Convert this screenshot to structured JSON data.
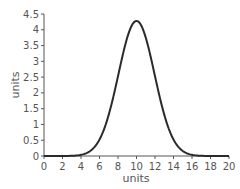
{
  "chart_data": {
    "type": "line",
    "title": "",
    "xlabel": "units",
    "ylabel": "units",
    "xlim": [
      0,
      20
    ],
    "ylim": [
      0,
      4.5
    ],
    "grid": false,
    "legend": null,
    "x_ticks": [
      "0",
      "2",
      "4",
      "6",
      "8",
      "10",
      "12",
      "14",
      "16",
      "18",
      "20"
    ],
    "y_ticks": [
      "0",
      "0.5",
      "1",
      "1.5",
      "2",
      "2.5",
      "3",
      "3.5",
      "4",
      "4.5"
    ],
    "series": [
      {
        "name": "curve",
        "x": [
          0,
          2,
          4,
          5,
          6,
          6.5,
          7,
          7.5,
          8,
          8.5,
          9,
          9.5,
          10,
          10.5,
          11,
          11.5,
          12,
          12.5,
          13,
          13.5,
          14,
          15,
          16,
          18,
          20
        ],
        "y": [
          0,
          0,
          0.01,
          0.08,
          0.35,
          0.75,
          1.35,
          2.1,
          2.9,
          3.6,
          4.05,
          4.25,
          4.28,
          4.25,
          4.05,
          3.6,
          2.9,
          2.1,
          1.35,
          0.75,
          0.35,
          0.08,
          0.01,
          0,
          0
        ]
      }
    ],
    "colors": {
      "line": "#2a2a2a",
      "axis": "#555555"
    }
  }
}
